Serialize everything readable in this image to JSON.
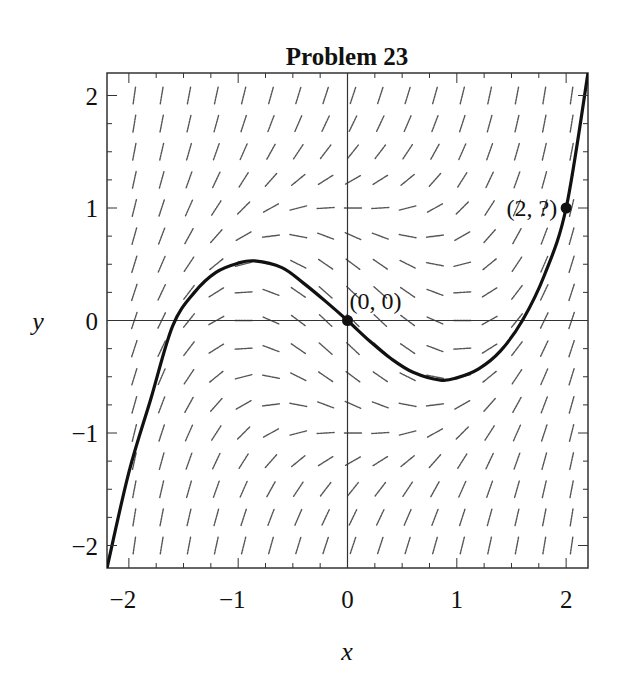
{
  "chart_data": {
    "type": "line",
    "title": "Problem 23",
    "xlabel": "x",
    "ylabel": "y",
    "xlim": [
      -2.2,
      2.2
    ],
    "ylim": [
      -2.2,
      2.2
    ],
    "grid": false,
    "legend": null,
    "x_ticks": [
      -2,
      -1,
      0,
      1,
      2
    ],
    "x_tick_labels": [
      "−2",
      "−1",
      "0",
      "1",
      "2"
    ],
    "y_ticks": [
      -2,
      -1,
      0,
      1,
      2
    ],
    "y_tick_labels": [
      "−2",
      "−1",
      "0",
      "1",
      "2"
    ],
    "minor_tick_step": 0.25,
    "slope_field": {
      "description": "direction field with short dashed segments on a 0.25 grid",
      "grid_step": 0.25,
      "equation_form": "dy/dx = x^2 + y^2 - 1 (approximate visual reading)"
    },
    "series": [
      {
        "name": "solution curve",
        "x": [
          -2.2,
          -2.0,
          -1.8,
          -1.6,
          -1.4,
          -1.2,
          -1.0,
          -0.85,
          -0.6,
          -0.4,
          -0.2,
          0.0,
          0.2,
          0.4,
          0.6,
          0.85,
          1.0,
          1.2,
          1.4,
          1.6,
          1.8,
          2.0,
          2.2
        ],
        "y": [
          -2.2,
          -1.35,
          -0.7,
          -0.05,
          0.25,
          0.43,
          0.51,
          0.53,
          0.47,
          0.33,
          0.17,
          0.0,
          -0.18,
          -0.34,
          -0.46,
          -0.53,
          -0.51,
          -0.43,
          -0.27,
          0.0,
          0.4,
          1.0,
          2.2
        ]
      }
    ],
    "annotations": [
      {
        "label": "(0, 0)",
        "x": 0,
        "y": 0,
        "marker": "filled-circle",
        "label_position": "upper-right"
      },
      {
        "label": "(2, ?)",
        "x": 2,
        "y": 1,
        "marker": "filled-circle",
        "label_position": "left"
      }
    ]
  },
  "colors": {
    "curve": "#111111",
    "field": "#555555",
    "frame": "#333333",
    "background": "#ffffff"
  }
}
